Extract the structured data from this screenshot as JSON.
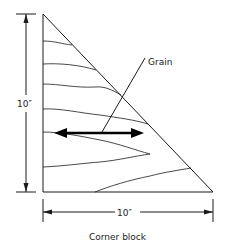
{
  "diagram": {
    "caption": "Corner block",
    "grain_label": "Grain",
    "height_label": "10″",
    "width_label": "10″",
    "colors": {
      "line": "#1a1a1a",
      "background": "#ffffff"
    }
  }
}
